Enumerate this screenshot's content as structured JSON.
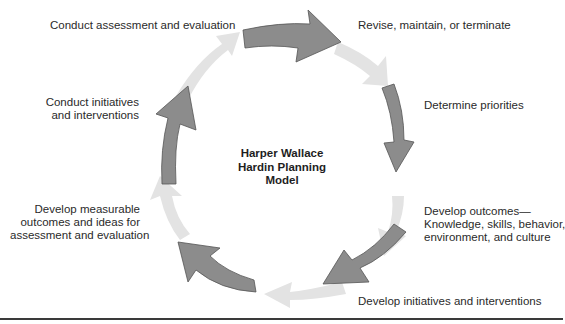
{
  "diagram": {
    "title": "Harper Wallace Hardin Planning Model",
    "title_lines": [
      "Harper Wallace",
      "Hardin Planning",
      "Model"
    ],
    "colors": {
      "dark_arrow": "#8c8c8c",
      "dark_arrow_stroke": "#555555",
      "light_arrow": "#e3e3e3",
      "text": "#2a2a2a",
      "rule": "#3a3a3a"
    },
    "steps": [
      {
        "id": "revise",
        "lines": [
          "Revise, maintain, or terminate"
        ]
      },
      {
        "id": "priorities",
        "lines": [
          "Determine priorities"
        ]
      },
      {
        "id": "outcomes",
        "lines": [
          "Develop outcomes—",
          "Knowledge, skills, behavior,",
          "environment, and culture"
        ]
      },
      {
        "id": "initiatives",
        "lines": [
          "Develop initiatives and interventions"
        ]
      },
      {
        "id": "measurable",
        "lines": [
          "Develop measurable",
          "outcomes and ideas for",
          "assessment and evaluation"
        ]
      },
      {
        "id": "conduct-initiatives",
        "lines": [
          "Conduct initiatives",
          "and interventions"
        ]
      },
      {
        "id": "conduct-assessment",
        "lines": [
          "Conduct assessment and evaluation"
        ]
      }
    ]
  }
}
